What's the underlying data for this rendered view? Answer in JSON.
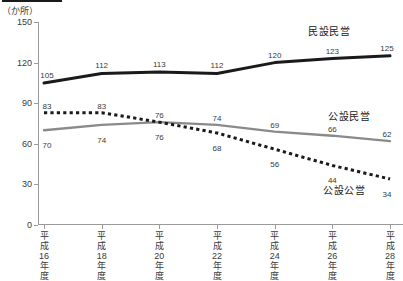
{
  "header": {
    "rule": ""
  },
  "axis": {
    "unit_label": "（か所）",
    "y_ticks": [
      {
        "label": "150",
        "value": 150
      },
      {
        "label": "120",
        "value": 120
      },
      {
        "label": "90",
        "value": 90
      },
      {
        "label": "60",
        "value": 60
      },
      {
        "label": "30",
        "value": 30
      },
      {
        "label": "0",
        "value": 0
      }
    ]
  },
  "chart_data": {
    "type": "line",
    "title": "",
    "xlabel": "",
    "ylabel": "（か所）",
    "ylim": [
      0,
      150
    ],
    "grid": false,
    "legend_position": "inline-right",
    "categories": [
      "平成16年度",
      "平成18年度",
      "平成20年度",
      "平成22年度",
      "平成24年度",
      "平成26年度",
      "平成28年度"
    ],
    "categories_lines": [
      [
        "平",
        "成",
        "16",
        "年",
        "度"
      ],
      [
        "平",
        "成",
        "18",
        "年",
        "度"
      ],
      [
        "平",
        "成",
        "20",
        "年",
        "度"
      ],
      [
        "平",
        "成",
        "22",
        "年",
        "度"
      ],
      [
        "平",
        "成",
        "24",
        "年",
        "度"
      ],
      [
        "平",
        "成",
        "26",
        "年",
        "度"
      ],
      [
        "平",
        "成",
        "28",
        "年",
        "度"
      ]
    ],
    "series": [
      {
        "name": "民設民営",
        "style": "solid-thick-black",
        "color": "#1a1a1a",
        "values": [
          105,
          112,
          113,
          112,
          120,
          123,
          125
        ],
        "label_offsets_y": [
          -11,
          -11,
          -11,
          -11,
          -11,
          -11,
          -11
        ]
      },
      {
        "name": "公設民営",
        "style": "solid-gray",
        "color": "#8a8a8a",
        "values": [
          70,
          74,
          76,
          74,
          69,
          66,
          62
        ],
        "label_offsets_y": [
          12,
          12,
          12,
          -10,
          -10,
          -10,
          -10
        ]
      },
      {
        "name": "公設公営",
        "style": "dotted-black",
        "color": "#1a1a1a",
        "values": [
          83,
          83,
          76,
          68,
          56,
          44,
          34
        ],
        "label_offsets_y": [
          -10,
          -10,
          -10,
          12,
          12,
          12,
          12
        ]
      }
    ]
  }
}
